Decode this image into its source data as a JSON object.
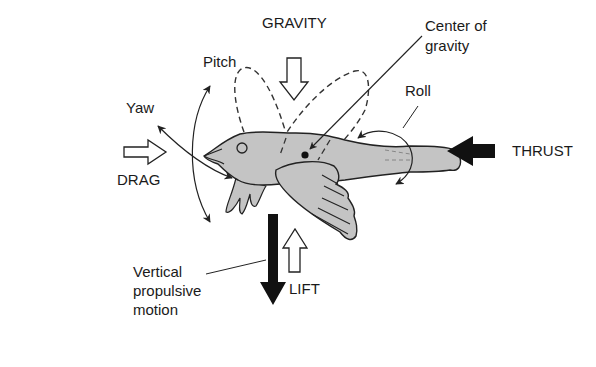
{
  "colors": {
    "bird_fill": "#c4c4c4",
    "stroke": "#222222",
    "background": "#ffffff",
    "solid_arrow": "#111111"
  },
  "labels": {
    "gravity": "GRAVITY",
    "center_of_gravity": "Center of\ngravity",
    "pitch": "Pitch",
    "yaw": "Yaw",
    "roll": "Roll",
    "drag": "DRAG",
    "thrust": "THRUST",
    "lift": "LIFT",
    "vertical_propulsive_motion": "Vertical\npropulsive\nmotion"
  },
  "arrows": [
    {
      "name": "gravity",
      "direction": "down",
      "style": "hollow"
    },
    {
      "name": "drag",
      "direction": "right",
      "style": "hollow"
    },
    {
      "name": "thrust",
      "direction": "left",
      "style": "solid"
    },
    {
      "name": "lift",
      "direction": "up",
      "style": "hollow"
    },
    {
      "name": "vertical-propulsive-motion",
      "direction": "down",
      "style": "solid"
    }
  ]
}
